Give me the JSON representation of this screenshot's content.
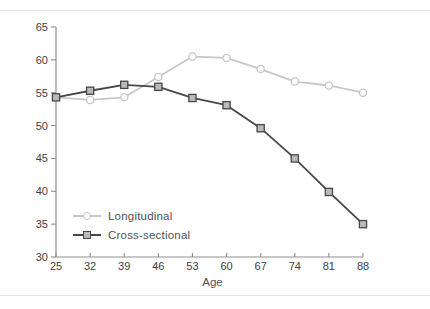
{
  "page": {
    "background": "#ffffff",
    "rule_color": "#e3e3e3"
  },
  "chart_data": {
    "type": "line",
    "title": "",
    "xlabel": "Age",
    "ylabel": "",
    "x": [
      25,
      32,
      39,
      46,
      53,
      60,
      67,
      74,
      81,
      88
    ],
    "xlim": [
      25,
      88
    ],
    "ylim": [
      30,
      65
    ],
    "yticks": [
      30,
      35,
      40,
      45,
      50,
      55,
      60,
      65
    ],
    "grid": false,
    "legend_position": "inside-lower-left",
    "series": [
      {
        "name": "Longitudinal",
        "marker": "circle",
        "color": "#c7c7c7",
        "marker_fill": "#fdfdfd",
        "values": [
          54.3,
          53.9,
          54.3,
          57.4,
          60.5,
          60.3,
          58.6,
          56.7,
          56.1,
          55.0
        ]
      },
      {
        "name": "Cross-sectional",
        "marker": "square",
        "color": "#474747",
        "marker_fill": "#b9b9b9",
        "values": [
          54.3,
          55.3,
          56.2,
          55.9,
          54.2,
          53.1,
          49.6,
          45.0,
          39.9,
          35.0
        ]
      }
    ],
    "axis_color": "#8f8f8f",
    "tick_label_color": "#3e3e3e",
    "xlabel_color": "#4f4f4f"
  }
}
